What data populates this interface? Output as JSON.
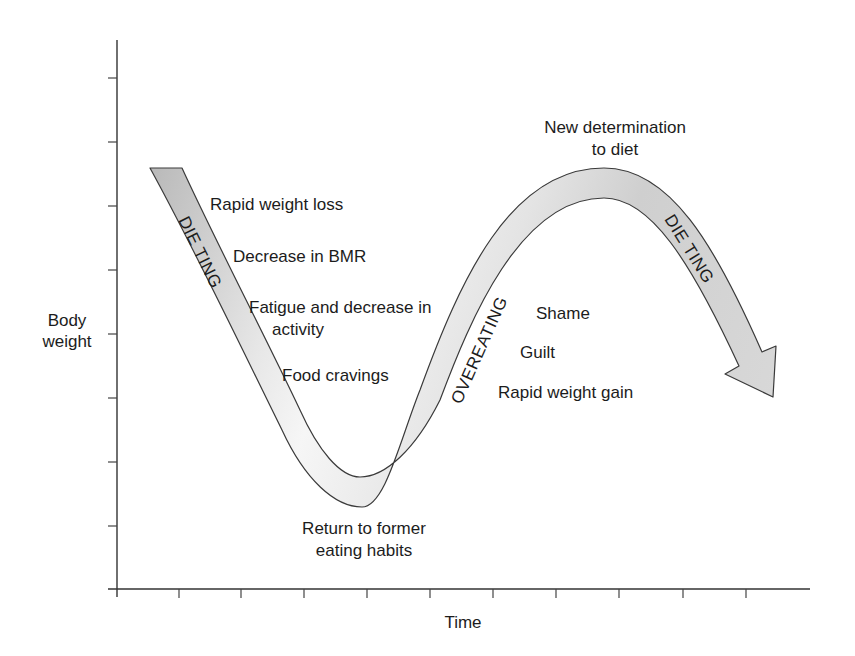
{
  "axes": {
    "y_label_line1": "Body",
    "y_label_line2": "weight",
    "x_label": "Time"
  },
  "bands": {
    "dieting_1": "DIE TING",
    "overeating": "OVEREATING",
    "dieting_2": "DIE TING"
  },
  "annotations": {
    "rapid_weight_loss": "Rapid weight loss",
    "decrease_bmr": "Decrease in BMR",
    "fatigue_line1": "Fatigue and decrease in",
    "fatigue_line2": "activity",
    "food_cravings": "Food cravings",
    "return_line1": "Return to former",
    "return_line2": "eating habits",
    "shame": "Shame",
    "guilt": "Guilt",
    "rapid_weight_gain": "Rapid weight gain",
    "new_det_line1": "New determination",
    "new_det_line2": "to diet"
  },
  "colors": {
    "axis": "#333333",
    "band_fill_dark": "#c4c4c4",
    "band_fill_light": "#f2f2f2",
    "band_stroke": "#3a3a3a"
  }
}
